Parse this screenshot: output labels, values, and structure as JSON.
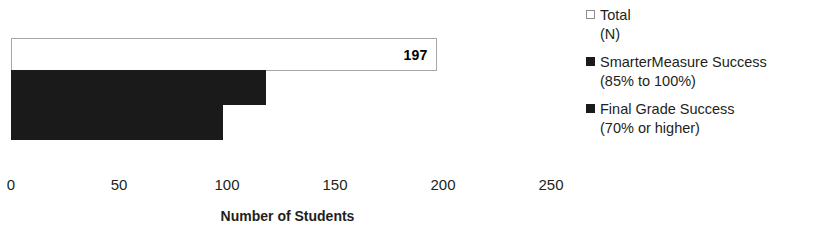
{
  "chart_data": {
    "type": "bar",
    "orientation": "horizontal",
    "title": "",
    "xlabel": "Number of Students",
    "ylabel": "",
    "xlim": [
      0,
      250
    ],
    "xticks": [
      0,
      50,
      100,
      150,
      200,
      250
    ],
    "xtick_labels": [
      "0",
      "50",
      "100",
      "150",
      "200",
      "250"
    ],
    "grid": false,
    "legend_position": "right",
    "categories": [
      ""
    ],
    "series": [
      {
        "name": "Total (N)",
        "legend_line1": "Total",
        "legend_line2": "(N)",
        "values": [
          197
        ],
        "data_label": "197",
        "color": "#ffffff",
        "border_color": "#a6a6a6",
        "marker": "open-square"
      },
      {
        "name": "SmarterMeasure Success (85% to 100%)",
        "legend_line1": "SmarterMeasure Success",
        "legend_line2": "(85% to 100%)",
        "values": [
          118
        ],
        "data_label": "",
        "color": "#1a1a1a",
        "border_color": "#1a1a1a",
        "marker": "filled-square"
      },
      {
        "name": "Final Grade Success (70% or higher)",
        "legend_line1": "Final Grade Success",
        "legend_line2": "(70% or higher)",
        "values": [
          98
        ],
        "data_label": "",
        "color": "#1a1a1a",
        "border_color": "#1a1a1a",
        "marker": "filled-square"
      }
    ]
  }
}
